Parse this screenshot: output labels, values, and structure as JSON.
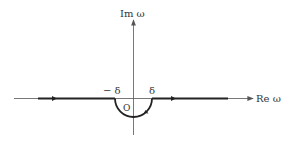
{
  "diagram": {
    "type": "contour-integral-path",
    "axes": {
      "horizontal_label": "Re ω",
      "vertical_label": "Im ω"
    },
    "labels": {
      "origin": "O",
      "neg_delta": "− δ",
      "pos_delta": "δ"
    },
    "colors": {
      "axis": "#555555",
      "contour": "#222222",
      "text": "#333333"
    }
  }
}
